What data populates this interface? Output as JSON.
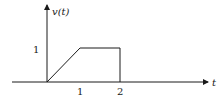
{
  "diagram": {
    "title": "",
    "y_axis_label": "v(t)",
    "x_axis_label": "t",
    "y_tick_label": "1",
    "x_tick_labels": [
      "1",
      "2"
    ],
    "line_color": "#1a1a1a",
    "waveform": {
      "description": "trapezoidal pulse: linear ramp from 0 to 1 over t=0..1, constant 1 over t=1..2, drops to 0 at t=2",
      "points": [
        [
          0,
          0
        ],
        [
          1,
          1
        ],
        [
          2,
          1
        ],
        [
          2,
          0
        ]
      ]
    }
  }
}
